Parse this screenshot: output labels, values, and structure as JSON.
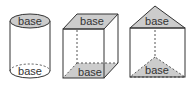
{
  "figure": {
    "colors": {
      "stroke": "#333333",
      "base_fill": "#cccccc",
      "background": "#ffffff"
    },
    "solids": [
      {
        "name": "cylinder",
        "top_label": "base",
        "bottom_label": "base"
      },
      {
        "name": "rectangular-prism",
        "top_label": "base",
        "bottom_label": "base"
      },
      {
        "name": "triangular-prism",
        "top_label": "base",
        "bottom_label": "base"
      }
    ]
  }
}
